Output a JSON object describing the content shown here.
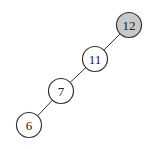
{
  "diagram": {
    "type": "binary-tree",
    "width": 155,
    "height": 149,
    "node_radius": 12.5,
    "colors": {
      "highlight_fill": "#c8c8c8",
      "default_fill": "#ffffff",
      "stroke": "#333333"
    },
    "nodes": [
      {
        "id": "n12",
        "label": "12",
        "cx": 129,
        "cy": 25,
        "highlighted": true
      },
      {
        "id": "n11",
        "label": "11",
        "cx": 95,
        "cy": 59,
        "highlighted": false
      },
      {
        "id": "n7",
        "label": "7",
        "cx": 61,
        "cy": 91,
        "highlighted": false
      },
      {
        "id": "n6",
        "label": "6",
        "cx": 29,
        "cy": 125,
        "highlighted": false
      }
    ],
    "edges": [
      {
        "from": "n12",
        "to": "n11"
      },
      {
        "from": "n11",
        "to": "n7"
      },
      {
        "from": "n7",
        "to": "n6"
      }
    ]
  }
}
